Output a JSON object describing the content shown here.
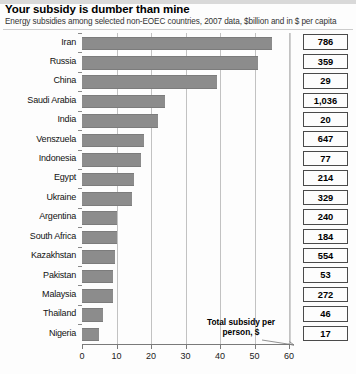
{
  "header": {
    "title": "Your subsidy is dumber than mine",
    "subtitle": "Energy subsidies among selected non-EOEC countries, 2007 data, $billion and in $ per capita"
  },
  "annotation": {
    "line1": "Total subsidy per",
    "line2": "person, $",
    "arrow_icon": "arrow-right-icon"
  },
  "chart_data": {
    "type": "bar",
    "orientation": "horizontal",
    "title": "Your subsidy is dumber than mine",
    "subtitle": "Energy subsidies among selected non-EOEC countries, 2007 data, $billion and in $ per capita",
    "xlabel": "",
    "ylabel": "",
    "xlim": [
      0,
      60
    ],
    "xticks": [
      0,
      10,
      20,
      30,
      40,
      50,
      60
    ],
    "xtick_labels": [
      "0",
      "10",
      "20",
      "30",
      "40",
      "50",
      "60"
    ],
    "grid": true,
    "legend": false,
    "categories": [
      "Iran",
      "Russia",
      "China",
      "Saudi Arabia",
      "India",
      "Venszuela",
      "Indonesia",
      "Egypt",
      "Ukraine",
      "Argentina",
      "South Africa",
      "Kazakhstan",
      "Pakistan",
      "Malaysia",
      "Thailand",
      "Nigeria"
    ],
    "series": [
      {
        "name": "Total subsidy, $billion",
        "values": [
          55,
          51,
          39,
          24,
          22,
          18,
          17,
          15,
          14.5,
          10,
          10,
          9.5,
          9,
          9,
          6,
          5
        ]
      }
    ],
    "data_labels": {
      "name": "Total subsidy per person, $",
      "values": [
        "786",
        "359",
        "29",
        "1,036",
        "20",
        "647",
        "77",
        "214",
        "329",
        "240",
        "184",
        "554",
        "53",
        "272",
        "46",
        "17"
      ]
    },
    "colors": {
      "bar": "#8c8c8c",
      "grid": "#c2c2c2",
      "axis": "#7a7a7a",
      "text": "#111111",
      "box_border": "#4a4a4a"
    }
  }
}
